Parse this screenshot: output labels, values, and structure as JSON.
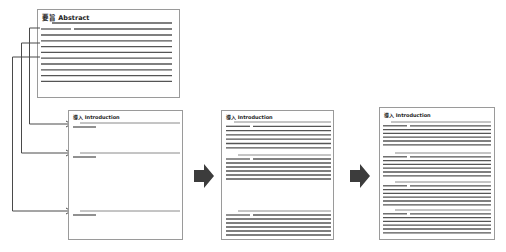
{
  "diagram": {
    "stages": [
      {
        "id": "abstract",
        "title": "要旨 Abstract",
        "paragraphs": 1
      },
      {
        "id": "introduction-step-1",
        "title": "導入 Introduction",
        "paragraphs": 3,
        "state": "topic sentences only"
      },
      {
        "id": "introduction-step-2",
        "title": "導入 Introduction",
        "paragraphs": 3,
        "state": "two paragraphs filled, one partially expanded"
      },
      {
        "id": "introduction-step-3",
        "title": "導入 Introduction",
        "paragraphs": 4,
        "state": "fully expanded"
      }
    ],
    "connectors": [
      {
        "from": "abstract sentence 1",
        "to": "introduction paragraph 1"
      },
      {
        "from": "abstract sentence 2",
        "to": "introduction paragraph 2"
      },
      {
        "from": "abstract sentence 3",
        "to": "introduction paragraph 3"
      }
    ],
    "flow_arrows": [
      {
        "from": "introduction-step-1",
        "to": "introduction-step-2",
        "icon": "right-arrow-icon"
      },
      {
        "from": "introduction-step-2",
        "to": "introduction-step-3",
        "icon": "right-arrow-icon"
      }
    ]
  }
}
